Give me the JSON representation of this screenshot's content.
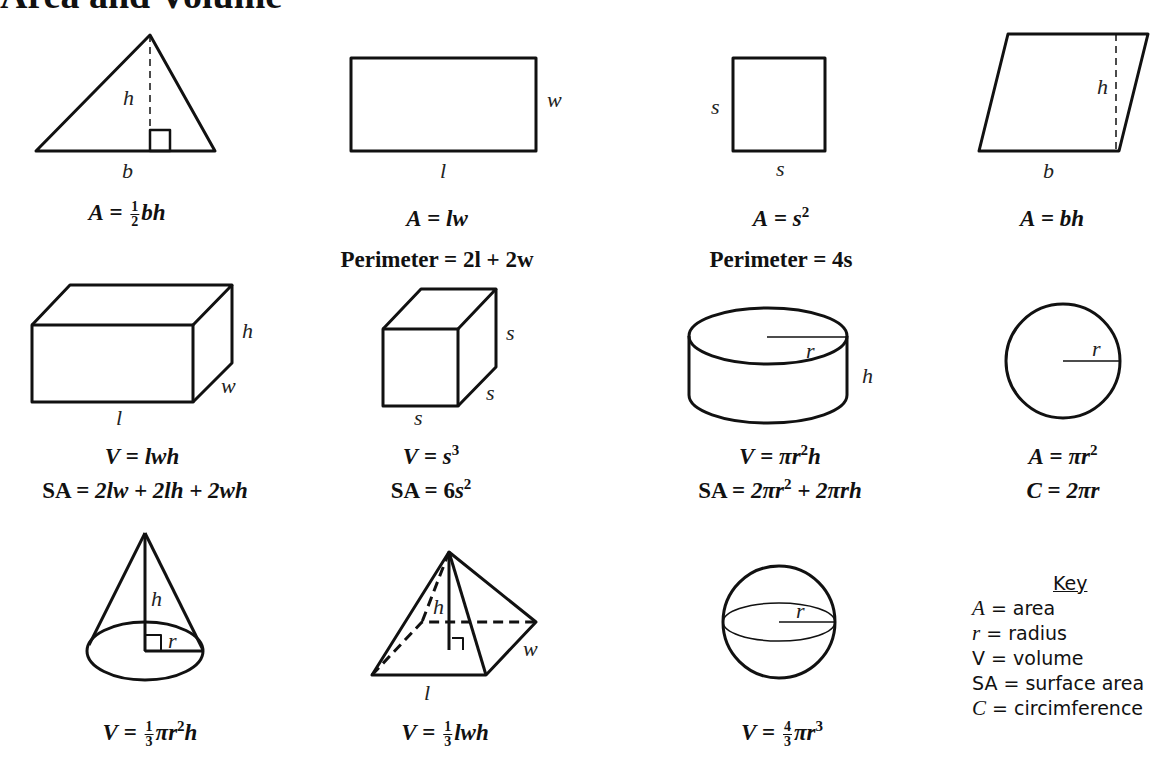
{
  "page": {
    "title": "Area and Volume"
  },
  "shapes": {
    "triangle": {
      "labels": {
        "height": "h",
        "base": "b"
      },
      "formula": {
        "lhs": "A",
        "eq": "=",
        "frac_num": "1",
        "frac_den": "2",
        "rhs": "bh"
      }
    },
    "rectangle": {
      "labels": {
        "width": "w",
        "length": "l"
      },
      "formula": {
        "area": "A = lw",
        "lhs": "A",
        "eq": "=",
        "rhs": "lw"
      },
      "perimeter": "Perimeter = 2l + 2w"
    },
    "square": {
      "labels": {
        "side_left": "s",
        "side_bottom": "s"
      },
      "formula": {
        "lhs": "A",
        "eq": "=",
        "base": "s",
        "exp": "2"
      },
      "perimeter": "Perimeter = 4s"
    },
    "parallelogram": {
      "labels": {
        "height": "h",
        "base": "b"
      },
      "formula": {
        "lhs": "A",
        "eq": "=",
        "rhs": "bh"
      }
    },
    "rectangular_prism": {
      "labels": {
        "height": "h",
        "width": "w",
        "length": "l"
      },
      "volume": {
        "lhs": "V",
        "eq": "=",
        "rhs": "lwh"
      },
      "surface_area": {
        "lhs": "SA",
        "eq": "=",
        "rhs": "2lw + 2lh + 2wh"
      }
    },
    "cube": {
      "labels": {
        "side_right": "s",
        "side_depth": "s",
        "side_bottom": "s"
      },
      "volume": {
        "lhs": "V",
        "eq": "=",
        "base": "s",
        "exp": "3"
      },
      "surface_area": {
        "lhs": "SA",
        "eq": "=",
        "coef": "6",
        "base": "s",
        "exp": "2"
      }
    },
    "cylinder": {
      "labels": {
        "radius": "r",
        "height": "h"
      },
      "volume": {
        "lhs": "V",
        "eq": "=",
        "pre": "πr",
        "exp": "2",
        "post": "h"
      },
      "surface_area": {
        "lhs": "SA",
        "eq": "=",
        "pre": "2πr",
        "exp": "2",
        "post": " + 2πrh"
      }
    },
    "circle": {
      "labels": {
        "radius": "r"
      },
      "area": {
        "lhs": "A",
        "eq": "=",
        "pre": "πr",
        "exp": "2"
      },
      "circumference": {
        "lhs": "C",
        "eq": "=",
        "rhs": "2πr"
      }
    },
    "cone": {
      "labels": {
        "height": "h",
        "radius": "r"
      },
      "volume": {
        "lhs": "V",
        "eq": "=",
        "frac_num": "1",
        "frac_den": "3",
        "pre": "πr",
        "exp": "2",
        "post": "h"
      }
    },
    "pyramid": {
      "labels": {
        "height": "h",
        "width": "w",
        "length": "l"
      },
      "volume": {
        "lhs": "V",
        "eq": "=",
        "frac_num": "1",
        "frac_den": "3",
        "rhs": "lwh"
      }
    },
    "sphere": {
      "labels": {
        "radius": "r"
      },
      "volume": {
        "lhs": "V",
        "eq": "=",
        "frac_num": "4",
        "frac_den": "3",
        "pre": "πr",
        "exp": "3"
      }
    }
  },
  "key": {
    "title": "Key",
    "items": [
      {
        "symbol": "A",
        "italic": true,
        "meaning": "= area"
      },
      {
        "symbol": "r",
        "italic": true,
        "meaning": "= radius"
      },
      {
        "symbol": "V",
        "italic": false,
        "meaning": "= volume"
      },
      {
        "symbol": "SA",
        "italic": false,
        "meaning": "= surface area"
      },
      {
        "symbol": "C",
        "italic": true,
        "meaning": "= circimference"
      }
    ]
  }
}
